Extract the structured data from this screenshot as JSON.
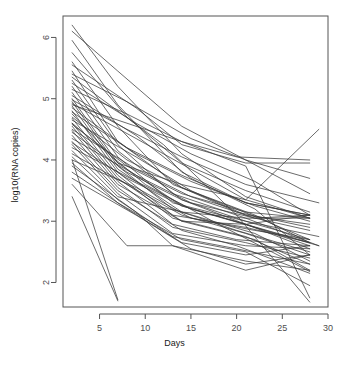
{
  "figure": {
    "background": "#ffffff",
    "line_color": "#3a3a3a",
    "axis_color": "#555555",
    "tick_label_color": "#4d4d4d"
  },
  "chart_data": {
    "type": "line",
    "title": "",
    "subtitle": "",
    "xlabel": "Days",
    "ylabel": "log10(RNA copies)",
    "xlim": [
      1,
      30
    ],
    "ylim": [
      1.6,
      6.35
    ],
    "xticks": [
      5,
      10,
      15,
      20,
      25,
      30
    ],
    "xticklabels": [
      "5",
      "10",
      "15",
      "20",
      "25",
      "30"
    ],
    "yticks": [
      2,
      3,
      4,
      5,
      6
    ],
    "yticklabels": [
      "2",
      "3",
      "4",
      "5",
      "6"
    ],
    "grid": false,
    "legend": null,
    "legend_position": "none",
    "annotations": [],
    "series_label": "subject trajectory",
    "series_count": 52,
    "series": [
      {
        "name": "s1",
        "x": [
          2,
          7,
          14,
          21,
          28
        ],
        "y": [
          6.2,
          5.2,
          4.1,
          3.4,
          3.05
        ]
      },
      {
        "name": "s2",
        "x": [
          2,
          7,
          14,
          21,
          28
        ],
        "y": [
          6.1,
          5.45,
          4.55,
          4.0,
          3.7
        ]
      },
      {
        "name": "s3",
        "x": [
          2,
          7,
          14,
          21,
          28
        ],
        "y": [
          5.95,
          4.9,
          3.8,
          3.3,
          3.1
        ]
      },
      {
        "name": "s4",
        "x": [
          2,
          8,
          14,
          21,
          28
        ],
        "y": [
          5.75,
          4.7,
          3.95,
          3.5,
          3.15
        ]
      },
      {
        "name": "s5",
        "x": [
          2,
          7,
          13,
          20,
          28
        ],
        "y": [
          5.6,
          4.55,
          3.6,
          3.2,
          2.7
        ]
      },
      {
        "name": "s6",
        "x": [
          2,
          9,
          14,
          21,
          28
        ],
        "y": [
          5.55,
          4.85,
          4.25,
          3.95,
          3.95
        ]
      },
      {
        "name": "s7",
        "x": [
          2,
          7,
          14,
          22,
          28
        ],
        "y": [
          5.45,
          4.3,
          3.55,
          3.1,
          2.65
        ]
      },
      {
        "name": "s8",
        "x": [
          2,
          8,
          15,
          21,
          28
        ],
        "y": [
          5.4,
          4.95,
          4.35,
          4.0,
          3.45
        ]
      },
      {
        "name": "s9",
        "x": [
          2,
          7,
          13,
          21,
          29
        ],
        "y": [
          5.3,
          4.25,
          3.45,
          3.05,
          2.6
        ]
      },
      {
        "name": "s10",
        "x": [
          2,
          9,
          15,
          22,
          28
        ],
        "y": [
          5.25,
          4.6,
          4.1,
          3.65,
          3.1
        ]
      },
      {
        "name": "s11",
        "x": [
          2,
          7,
          14,
          21,
          28
        ],
        "y": [
          5.2,
          4.15,
          3.35,
          2.95,
          2.55
        ]
      },
      {
        "name": "s12",
        "x": [
          2,
          8,
          14,
          20,
          28
        ],
        "y": [
          5.15,
          4.75,
          4.3,
          4.05,
          4.0
        ]
      },
      {
        "name": "s13",
        "x": [
          2,
          7,
          13,
          21,
          28
        ],
        "y": [
          5.1,
          4.05,
          3.3,
          3.0,
          2.7
        ]
      },
      {
        "name": "s14",
        "x": [
          2,
          9,
          15,
          22,
          28
        ],
        "y": [
          5.05,
          4.4,
          3.7,
          3.2,
          2.45
        ]
      },
      {
        "name": "s15",
        "x": [
          2,
          7,
          14,
          21,
          28
        ],
        "y": [
          5.0,
          3.95,
          3.25,
          2.95,
          2.6
        ]
      },
      {
        "name": "s16",
        "x": [
          2,
          8,
          14,
          21,
          29
        ],
        "y": [
          4.98,
          4.5,
          4.05,
          3.6,
          3.3
        ]
      },
      {
        "name": "s17",
        "x": [
          2,
          7,
          13,
          20,
          28
        ],
        "y": [
          4.95,
          3.9,
          3.2,
          2.85,
          2.5
        ]
      },
      {
        "name": "s18",
        "x": [
          2,
          9,
          15,
          21,
          28
        ],
        "y": [
          4.92,
          4.35,
          3.85,
          3.35,
          3.05
        ]
      },
      {
        "name": "s19",
        "x": [
          2,
          7,
          14,
          22,
          28
        ],
        "y": [
          4.88,
          3.85,
          3.15,
          2.8,
          2.35
        ]
      },
      {
        "name": "s20",
        "x": [
          2,
          8,
          14,
          21,
          28
        ],
        "y": [
          4.85,
          4.2,
          3.75,
          3.3,
          3.1
        ]
      },
      {
        "name": "s21",
        "x": [
          2,
          7,
          13,
          21,
          28
        ],
        "y": [
          4.8,
          3.8,
          3.1,
          2.9,
          2.65
        ]
      },
      {
        "name": "s22",
        "x": [
          2,
          9,
          15,
          22,
          28
        ],
        "y": [
          4.78,
          4.1,
          3.65,
          3.25,
          3.0
        ]
      },
      {
        "name": "s23",
        "x": [
          2,
          7,
          14,
          21,
          29
        ],
        "y": [
          4.75,
          3.95,
          3.6,
          3.35,
          4.5
        ]
      },
      {
        "name": "s24",
        "x": [
          2,
          8,
          14,
          20,
          28
        ],
        "y": [
          4.7,
          4.0,
          3.55,
          3.15,
          2.9
        ]
      },
      {
        "name": "s25",
        "x": [
          2,
          7,
          13,
          21,
          28
        ],
        "y": [
          4.68,
          3.75,
          3.05,
          2.75,
          2.3
        ]
      },
      {
        "name": "s26",
        "x": [
          2,
          9,
          15,
          21,
          28
        ],
        "y": [
          4.65,
          4.05,
          3.5,
          3.1,
          2.95
        ]
      },
      {
        "name": "s27",
        "x": [
          2,
          7,
          14,
          22,
          28
        ],
        "y": [
          4.6,
          3.7,
          3.0,
          2.7,
          2.2
        ]
      },
      {
        "name": "s28",
        "x": [
          2,
          8,
          14,
          21,
          28
        ],
        "y": [
          4.58,
          3.9,
          3.45,
          3.15,
          3.05
        ]
      },
      {
        "name": "s29",
        "x": [
          2,
          7,
          13,
          20,
          28
        ],
        "y": [
          4.55,
          3.65,
          2.95,
          2.7,
          2.6
        ]
      },
      {
        "name": "s30",
        "x": [
          2,
          9,
          15,
          22,
          28
        ],
        "y": [
          4.5,
          3.85,
          3.4,
          3.05,
          2.85
        ]
      },
      {
        "name": "s31",
        "x": [
          2,
          7,
          14,
          21,
          28
        ],
        "y": [
          4.48,
          3.6,
          3.0,
          2.95,
          3.1
        ]
      },
      {
        "name": "s32",
        "x": [
          2,
          8,
          14,
          21,
          29
        ],
        "y": [
          4.45,
          3.8,
          3.35,
          3.0,
          2.75
        ]
      },
      {
        "name": "s33",
        "x": [
          2,
          7,
          13,
          21,
          28
        ],
        "y": [
          4.4,
          3.55,
          2.9,
          2.65,
          2.4
        ]
      },
      {
        "name": "s34",
        "x": [
          2,
          9,
          15,
          22,
          28
        ],
        "y": [
          4.35,
          3.75,
          3.3,
          3.05,
          3.1
        ]
      },
      {
        "name": "s35",
        "x": [
          2,
          7,
          14,
          20,
          28
        ],
        "y": [
          4.3,
          3.5,
          2.85,
          2.6,
          2.15
        ]
      },
      {
        "name": "s36",
        "x": [
          2,
          8,
          14,
          21,
          28
        ],
        "y": [
          4.28,
          3.7,
          3.25,
          2.95,
          2.65
        ]
      },
      {
        "name": "s37",
        "x": [
          2,
          7,
          13,
          21,
          28
        ],
        "y": [
          4.25,
          3.45,
          2.8,
          2.6,
          2.55
        ]
      },
      {
        "name": "s38",
        "x": [
          2,
          9,
          15,
          22,
          29
        ],
        "y": [
          4.2,
          3.65,
          3.2,
          2.9,
          2.6
        ]
      },
      {
        "name": "s39",
        "x": [
          2,
          7,
          14,
          21,
          28
        ],
        "y": [
          4.15,
          3.4,
          3.15,
          3.05,
          3.05
        ]
      },
      {
        "name": "s40",
        "x": [
          2,
          8,
          14,
          21,
          28
        ],
        "y": [
          4.1,
          3.6,
          3.1,
          2.8,
          2.45
        ]
      },
      {
        "name": "s41",
        "x": [
          2,
          7,
          13,
          20,
          28
        ],
        "y": [
          4.05,
          3.35,
          2.75,
          2.55,
          2.3
        ]
      },
      {
        "name": "s42",
        "x": [
          2,
          9,
          15,
          22,
          28
        ],
        "y": [
          4.0,
          3.55,
          3.05,
          2.85,
          2.7
        ]
      },
      {
        "name": "s43",
        "x": [
          2,
          7,
          14,
          21,
          28
        ],
        "y": [
          3.95,
          3.3,
          2.7,
          2.5,
          1.95
        ]
      },
      {
        "name": "s44",
        "x": [
          2,
          9,
          13,
          21,
          28
        ],
        "y": [
          3.9,
          3.15,
          2.6,
          2.35,
          2.2
        ]
      },
      {
        "name": "s45",
        "x": [
          2,
          8,
          14,
          21,
          28
        ],
        "y": [
          3.8,
          3.2,
          2.65,
          2.45,
          2.6
        ]
      },
      {
        "name": "s46",
        "x": [
          2,
          9,
          15,
          21,
          28
        ],
        "y": [
          3.7,
          3.1,
          2.55,
          2.3,
          2.45
        ]
      },
      {
        "name": "s47",
        "x": [
          2,
          8,
          13,
          21,
          28
        ],
        "y": [
          3.6,
          2.6,
          2.6,
          2.2,
          2.45
        ]
      },
      {
        "name": "s48",
        "x": [
          2,
          7
        ],
        "y": [
          4.0,
          1.72
        ]
      },
      {
        "name": "s49",
        "x": [
          2,
          7
        ],
        "y": [
          3.4,
          1.7
        ]
      },
      {
        "name": "s50",
        "x": [
          2,
          14,
          21,
          28
        ],
        "y": [
          4.9,
          4.3,
          3.9,
          1.75
        ]
      },
      {
        "name": "s51",
        "x": [
          2,
          12,
          20,
          28
        ],
        "y": [
          5.35,
          4.25,
          3.1,
          1.68
        ]
      },
      {
        "name": "s52",
        "x": [
          2,
          10,
          18,
          28
        ],
        "y": [
          4.6,
          3.6,
          2.95,
          2.18
        ]
      }
    ]
  }
}
